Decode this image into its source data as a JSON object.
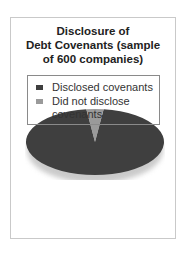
{
  "chart_data": {
    "type": "pie",
    "title": "Disclosure of Debt Covenants (sample of 600 companies)",
    "title_lines": [
      "Disclosure of",
      "Debt Covenants (sample",
      "of 600 companies)"
    ],
    "categories": [
      "Disclosed covenants",
      "Did not disclose covenants"
    ],
    "values": [
      96,
      4
    ],
    "colors": [
      "#3f3f3f",
      "#9a9a9a"
    ],
    "legend": {
      "position": "bottom",
      "entries": [
        {
          "label_lines": [
            "Disclosed covenants"
          ],
          "color": "#3f3f3f"
        },
        {
          "label_lines": [
            "Did not disclose",
            "covenants"
          ],
          "color": "#9a9a9a"
        }
      ]
    },
    "style": "3d-tilted-pie"
  }
}
